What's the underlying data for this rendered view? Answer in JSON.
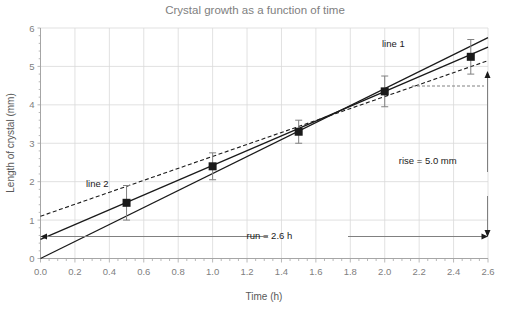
{
  "chart_data": {
    "type": "scatter",
    "title": "Crystal growth as a function of time",
    "xlabel": "Time (h)",
    "ylabel": "Length of crystal (mm)",
    "xlim": [
      0.0,
      2.6
    ],
    "ylim": [
      0,
      6
    ],
    "grid": true,
    "legend": "none",
    "x_ticks": [
      "0.0",
      "0.2",
      "0.4",
      "0.6",
      "0.8",
      "1.0",
      "1.2",
      "1.4",
      "1.6",
      "1.8",
      "2.0",
      "2.2",
      "2.4",
      "2.6"
    ],
    "x_tick_values": [
      0.0,
      0.2,
      0.4,
      0.6,
      0.8,
      1.0,
      1.2,
      1.4,
      1.6,
      1.8,
      2.0,
      2.2,
      2.4,
      2.6
    ],
    "y_ticks": [
      "0",
      "1",
      "2",
      "3",
      "4",
      "5",
      "6"
    ],
    "y_tick_values": [
      0,
      1,
      2,
      3,
      4,
      5,
      6
    ],
    "x": [
      0.5,
      1.0,
      1.5,
      2.0,
      2.5
    ],
    "values": [
      1.45,
      2.4,
      3.3,
      4.35,
      5.25
    ],
    "yerr": [
      0.45,
      0.35,
      0.3,
      0.4,
      0.45
    ],
    "series": [
      {
        "name": "data points",
        "type": "scatter",
        "x": [
          0.5,
          1.0,
          1.5,
          2.0,
          2.5
        ],
        "values": [
          1.45,
          2.4,
          3.3,
          4.35,
          5.25
        ],
        "yerr": [
          0.45,
          0.35,
          0.3,
          0.4,
          0.45
        ],
        "marker": "square",
        "color": "#1a1a1a"
      },
      {
        "name": "line 1",
        "type": "line",
        "style": "solid",
        "x": [
          0.0,
          2.6
        ],
        "values": [
          0.5,
          5.5
        ],
        "color": "#1a1a1a"
      },
      {
        "name": "line 2",
        "type": "line",
        "style": "dashed",
        "x": [
          0.0,
          2.6
        ],
        "values": [
          1.1,
          5.15
        ],
        "color": "#1a1a1a"
      },
      {
        "name": "steep line",
        "type": "line",
        "style": "solid",
        "x": [
          0.0,
          2.6
        ],
        "values": [
          0.0,
          5.75
        ],
        "color": "#1a1a1a"
      }
    ],
    "annotations": [
      {
        "name": "line-1-label",
        "text": "line 1",
        "x": 2.05,
        "y": 5.5
      },
      {
        "name": "line-2-label",
        "text": "line 2",
        "x": 0.33,
        "y": 1.85
      },
      {
        "name": "rise-label",
        "text": "rise = 5.0 mm",
        "x": 2.25,
        "y": 2.45
      },
      {
        "name": "run-label",
        "text": "run = 2.6 h",
        "x": 1.33,
        "y": 0.5
      }
    ],
    "rise_value": "5.0",
    "rise_unit": "mm",
    "run_value": "2.6",
    "run_unit": "h",
    "colors": {
      "title": "#808080",
      "axis_text": "#808080",
      "axis_label": "#595959",
      "gridlines": "#d9d9d9",
      "data": "#1a1a1a",
      "errorbar": "#808080",
      "annotation_line": "#808080"
    }
  }
}
